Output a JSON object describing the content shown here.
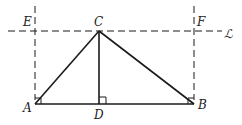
{
  "diagram": {
    "type": "geometry",
    "points": {
      "A": {
        "label": "A",
        "x": 35,
        "y": 104
      },
      "B": {
        "label": "B",
        "x": 194,
        "y": 104
      },
      "C": {
        "label": "C",
        "x": 99,
        "y": 31
      },
      "D": {
        "label": "D",
        "x": 99,
        "y": 104
      },
      "E": {
        "label": "E",
        "x": 35,
        "y": 31
      },
      "F": {
        "label": "F",
        "x": 194,
        "y": 31
      }
    },
    "line_label": "ℒ",
    "solid_segments": [
      "AB",
      "AC",
      "BC",
      "CD"
    ],
    "dashed_lines": [
      "line L (through C, parallel to AB)",
      "AE extended",
      "BF extended"
    ],
    "right_angle_marks": [
      "A",
      "B",
      "D"
    ],
    "stroke_color": "#1a1a1a"
  }
}
